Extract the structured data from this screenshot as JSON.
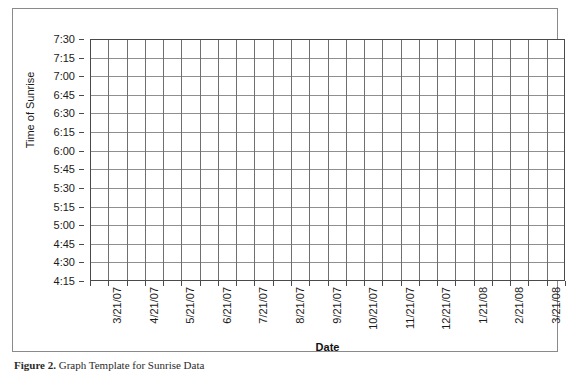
{
  "figure": {
    "caption_label": "Figure 2.",
    "caption_text": "Graph Template for Sunrise Data"
  },
  "chart_data": {
    "type": "line",
    "title": "",
    "subtitle": "",
    "xlabel": "Date",
    "ylabel": "Time of Sunrise",
    "grid": true,
    "legend": "none",
    "series": [],
    "note": "Empty plotting grid template - no data points are drawn",
    "categories": [
      "3/21/07",
      "4/21/07",
      "5/21/07",
      "6/21/07",
      "7/21/07",
      "8/21/07",
      "9/21/07",
      "10/21/07",
      "11/21/07",
      "12/21/07",
      "1/21/08",
      "2/21/08",
      "3/21/08"
    ],
    "x_tick_labels": [
      "3/21/07",
      "4/21/07",
      "5/21/07",
      "6/21/07",
      "7/21/07",
      "8/21/07",
      "9/21/07",
      "10/21/07",
      "11/21/07",
      "12/21/07",
      "1/21/08",
      "2/21/08",
      "3/21/08"
    ],
    "x_minor_divisions": 26,
    "y_tick_labels": [
      "7:30",
      "7:15",
      "7:00",
      "6:45",
      "6:30",
      "6:15",
      "6:00",
      "5:45",
      "5:30",
      "5:15",
      "5:00",
      "4:45",
      "4:30",
      "4:15"
    ],
    "ylim": [
      "4:15",
      "7:30"
    ],
    "y_tick_interval_minutes": 15,
    "y_axis_inverted": true,
    "colors": {
      "plot_border": "#4a4a4a",
      "gridline_horizontal": "#8f8f8f",
      "gridline_vertical": "#6f6f6f",
      "figure_border": "#8a8a8a",
      "text": "#1a1a1a",
      "background": "#ffffff"
    }
  }
}
